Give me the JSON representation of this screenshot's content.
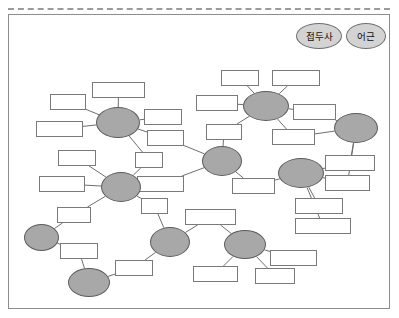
{
  "legend": {
    "items": [
      {
        "label": "접두사",
        "x": 296,
        "y": 23,
        "w": 44,
        "h": 24
      },
      {
        "label": "어근",
        "x": 346,
        "y": 23,
        "w": 38,
        "h": 24
      }
    ]
  },
  "diagram": {
    "type": "word-root-network",
    "roots": [
      {
        "id": "vis",
        "label": "vis",
        "x": 96,
        "y": 107,
        "w": 44,
        "h": 31
      },
      {
        "id": "it",
        "label": "it",
        "x": 101,
        "y": 172,
        "w": 40,
        "h": 30
      },
      {
        "id": "in",
        "label": "in",
        "x": 24,
        "y": 224,
        "w": 35,
        "h": 27
      },
      {
        "id": "port",
        "label": "port",
        "x": 68,
        "y": 268,
        "w": 42,
        "h": 29
      },
      {
        "id": "ex",
        "label": "ex",
        "x": 150,
        "y": 227,
        "w": 40,
        "h": 30
      },
      {
        "id": "re",
        "label": "re",
        "x": 202,
        "y": 146,
        "w": 40,
        "h": 30
      },
      {
        "id": "tain",
        "label": "tain",
        "x": 243,
        "y": 91,
        "w": 46,
        "h": 30
      },
      {
        "id": "con",
        "label": "con",
        "x": 334,
        "y": 113,
        "w": 44,
        "h": 30
      },
      {
        "id": "ceive",
        "label": "ceive",
        "x": 278,
        "y": 158,
        "w": 46,
        "h": 30
      },
      {
        "id": "vac",
        "label": "vac",
        "x": 224,
        "y": 230,
        "w": 42,
        "h": 29
      }
    ],
    "leaves": [
      {
        "id": "supervise",
        "label": "supervise",
        "x": 92,
        "y": 82
      },
      {
        "id": "vision",
        "label": "vision",
        "x": 50,
        "y": 94
      },
      {
        "id": "visible",
        "label": "visible",
        "x": 144,
        "y": 109
      },
      {
        "id": "envision",
        "label": "envision",
        "x": 36,
        "y": 121
      },
      {
        "id": "revisit",
        "label": "revisit",
        "x": 147,
        "y": 130
      },
      {
        "id": "visit",
        "label": "visit",
        "x": 135,
        "y": 152
      },
      {
        "id": "transit",
        "label": "transit",
        "x": 58,
        "y": 150
      },
      {
        "id": "itinerary",
        "label": "itinerary",
        "x": 39,
        "y": 176
      },
      {
        "id": "reiterate",
        "label": "reiterate",
        "x": 137,
        "y": 176
      },
      {
        "id": "initial",
        "label": "initial",
        "x": 57,
        "y": 207
      },
      {
        "id": "exit",
        "label": "exit",
        "x": 141,
        "y": 198
      },
      {
        "id": "import",
        "label": "import",
        "x": 60,
        "y": 243
      },
      {
        "id": "export",
        "label": "export",
        "x": 115,
        "y": 260
      },
      {
        "id": "evacuate",
        "label": "evacuate",
        "x": 185,
        "y": 209
      },
      {
        "id": "vacuum",
        "label": "vacuum",
        "x": 193,
        "y": 266
      },
      {
        "id": "vacant",
        "label": "vacant",
        "x": 255,
        "y": 268
      },
      {
        "id": "vacation",
        "label": "vacation",
        "x": 270,
        "y": 250
      },
      {
        "id": "detain",
        "label": "detain",
        "x": 221,
        "y": 70
      },
      {
        "id": "maintain",
        "label": "maintain",
        "x": 272,
        "y": 70
      },
      {
        "id": "sustain",
        "label": "sustain",
        "x": 196,
        "y": 95
      },
      {
        "id": "retain",
        "label": "retain",
        "x": 206,
        "y": 124
      },
      {
        "id": "contain",
        "label": "contain",
        "x": 293,
        "y": 104
      },
      {
        "id": "content",
        "label": "content",
        "x": 272,
        "y": 129
      },
      {
        "id": "conceive",
        "label": "conceive",
        "x": 325,
        "y": 155
      },
      {
        "id": "concept",
        "label": "concept",
        "x": 325,
        "y": 175
      },
      {
        "id": "perceive",
        "label": "perceive",
        "x": 295,
        "y": 198
      },
      {
        "id": "perception",
        "label": "perception",
        "x": 295,
        "y": 218
      },
      {
        "id": "receive",
        "label": "receive",
        "x": 232,
        "y": 178
      }
    ],
    "edges": [
      [
        "vis",
        "supervise"
      ],
      [
        "vis",
        "vision"
      ],
      [
        "vis",
        "envision"
      ],
      [
        "vis",
        "visible"
      ],
      [
        "vis",
        "revisit"
      ],
      [
        "vis",
        "visit"
      ],
      [
        "it",
        "transit"
      ],
      [
        "it",
        "itinerary"
      ],
      [
        "it",
        "reiterate"
      ],
      [
        "it",
        "initial"
      ],
      [
        "it",
        "exit"
      ],
      [
        "it",
        "visit"
      ],
      [
        "in",
        "initial"
      ],
      [
        "in",
        "import"
      ],
      [
        "port",
        "import"
      ],
      [
        "port",
        "export"
      ],
      [
        "ex",
        "exit"
      ],
      [
        "ex",
        "export"
      ],
      [
        "ex",
        "evacuate"
      ],
      [
        "re",
        "revisit"
      ],
      [
        "re",
        "reiterate"
      ],
      [
        "re",
        "retain"
      ],
      [
        "re",
        "receive"
      ],
      [
        "tain",
        "detain"
      ],
      [
        "tain",
        "maintain"
      ],
      [
        "tain",
        "sustain"
      ],
      [
        "tain",
        "retain"
      ],
      [
        "tain",
        "contain"
      ],
      [
        "tain",
        "content"
      ],
      [
        "con",
        "contain"
      ],
      [
        "con",
        "content"
      ],
      [
        "con",
        "conceive"
      ],
      [
        "con",
        "concept"
      ],
      [
        "ceive",
        "conceive"
      ],
      [
        "ceive",
        "concept"
      ],
      [
        "ceive",
        "perceive"
      ],
      [
        "ceive",
        "perception"
      ],
      [
        "ceive",
        "receive"
      ],
      [
        "vac",
        "evacuate"
      ],
      [
        "vac",
        "vacuum"
      ],
      [
        "vac",
        "vacant"
      ],
      [
        "vac",
        "vacation"
      ]
    ]
  },
  "style": {
    "root_fill": "#a8a8a8",
    "leaf_fill": "#ffffff",
    "line_color": "#6e6e6e",
    "border_color": "#8d8d8d",
    "legend_fill": "#d3d3d3"
  }
}
